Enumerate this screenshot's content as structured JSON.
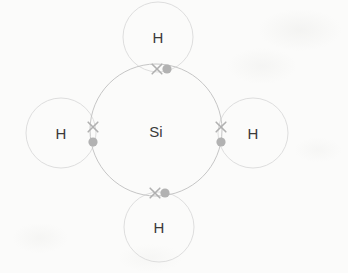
{
  "diagram": {
    "type": "dot-and-cross-lewis-structure",
    "molecule_formula": "SiH4",
    "background_color": "#fbfbfa",
    "shell_stroke_color": "#c9c9c9",
    "shell_stroke_color_light": "#dedede",
    "label_color": "#3a3a3a",
    "electron_color": "#b0b0b0",
    "central_atom": {
      "symbol": "Si",
      "name": "silicon",
      "cx": 156,
      "cy": 130,
      "r": 66,
      "label_font_size": 15
    },
    "outer_atoms": [
      {
        "symbol": "H",
        "name": "hydrogen-top",
        "position": "top",
        "cx": 158,
        "cy": 37,
        "r": 35
      },
      {
        "symbol": "H",
        "name": "hydrogen-left",
        "position": "left",
        "cx": 61,
        "cy": 133,
        "r": 35
      },
      {
        "symbol": "H",
        "name": "hydrogen-right",
        "position": "right",
        "cx": 253,
        "cy": 133,
        "r": 35
      },
      {
        "symbol": "H",
        "name": "hydrogen-bottom",
        "position": "bottom",
        "cx": 159,
        "cy": 227,
        "r": 35
      }
    ],
    "bond_pairs": [
      {
        "name": "bond-pair-top",
        "bond": "Si-H top",
        "orientation": "horizontal",
        "cross": {
          "x": 157,
          "y": 69,
          "symbol": "x",
          "source": "Si"
        },
        "dot": {
          "x": 167,
          "y": 69,
          "symbol": "dot",
          "source": "H"
        }
      },
      {
        "name": "bond-pair-left",
        "bond": "Si-H left",
        "orientation": "vertical",
        "cross": {
          "x": 93,
          "y": 127,
          "symbol": "x",
          "source": "Si"
        },
        "dot": {
          "x": 93,
          "y": 142,
          "symbol": "dot",
          "source": "H"
        }
      },
      {
        "name": "bond-pair-right",
        "bond": "Si-H right",
        "orientation": "vertical",
        "cross": {
          "x": 221,
          "y": 127,
          "symbol": "x",
          "source": "Si"
        },
        "dot": {
          "x": 221,
          "y": 142,
          "symbol": "dot",
          "source": "H"
        }
      },
      {
        "name": "bond-pair-bottom",
        "bond": "Si-H bottom",
        "orientation": "horizontal",
        "cross": {
          "x": 155,
          "y": 193,
          "symbol": "x",
          "source": "Si"
        },
        "dot": {
          "x": 165,
          "y": 193,
          "symbol": "dot",
          "source": "H"
        }
      }
    ],
    "labels": {
      "center": "Si",
      "top": "H",
      "left": "H",
      "right": "H",
      "bottom": "H"
    }
  }
}
